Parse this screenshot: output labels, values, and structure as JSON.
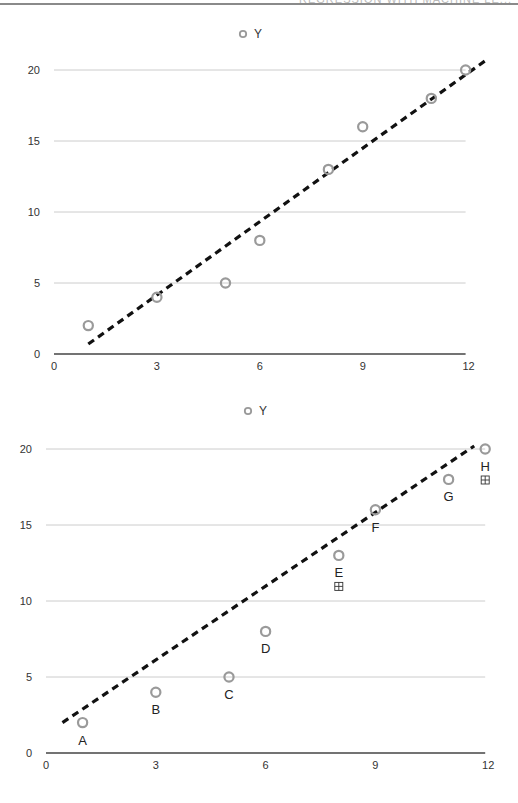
{
  "header": {
    "text": "REGRESSION WITH MACHINE LE..."
  },
  "chart_data": [
    {
      "type": "scatter",
      "title": "",
      "legend": [
        "Y"
      ],
      "legend_position": "top",
      "xlabel": "",
      "ylabel": "",
      "xlim": [
        0,
        12
      ],
      "ylim": [
        0,
        20
      ],
      "xticks": [
        0,
        3,
        6,
        9,
        12
      ],
      "yticks": [
        0,
        5,
        10,
        15,
        20
      ],
      "grid": true,
      "series": [
        {
          "name": "Y",
          "x": [
            1,
            3,
            5,
            6,
            8,
            9,
            11,
            12
          ],
          "y": [
            2,
            4,
            5,
            8,
            13,
            16,
            18,
            20
          ]
        }
      ],
      "trendline": {
        "style": "dashed",
        "x0": 1,
        "y0": 0.7,
        "x1": 12.6,
        "y1": 20.7
      },
      "layout": {
        "top": 20,
        "height": 360,
        "x0px": 54,
        "xpx_per": 34.3,
        "y0px": 334,
        "ypx_per": 14.2,
        "legend_x": 243,
        "legend_y": 14
      }
    },
    {
      "type": "scatter",
      "title": "",
      "legend": [
        "Y"
      ],
      "legend_position": "top",
      "xlabel": "",
      "ylabel": "",
      "xlim": [
        0,
        12
      ],
      "ylim": [
        0,
        20
      ],
      "xticks": [
        0,
        3,
        6,
        9,
        12
      ],
      "yticks": [
        0,
        5,
        10,
        15,
        20
      ],
      "grid": true,
      "series": [
        {
          "name": "Y",
          "x": [
            1,
            3,
            5,
            6,
            8,
            9,
            11,
            12
          ],
          "y": [
            2,
            4,
            5,
            8,
            13,
            16,
            18,
            20
          ],
          "labels": [
            "A",
            "B",
            "C",
            "D",
            "E",
            "F",
            "G",
            "H"
          ]
        }
      ],
      "annotations": [
        {
          "near": "E",
          "symbol": "⊞"
        },
        {
          "near": "H",
          "symbol": "⊞"
        }
      ],
      "trendline": {
        "style": "dashed",
        "x0": 0.45,
        "y0": 2.0,
        "x1": 11.7,
        "y1": 20.2
      },
      "layout": {
        "top": 395,
        "height": 408,
        "x0px": 46,
        "xpx_per": 36.6,
        "y0px": 358,
        "ypx_per": 15.2,
        "legend_x": 248,
        "legend_y": 16
      }
    }
  ]
}
